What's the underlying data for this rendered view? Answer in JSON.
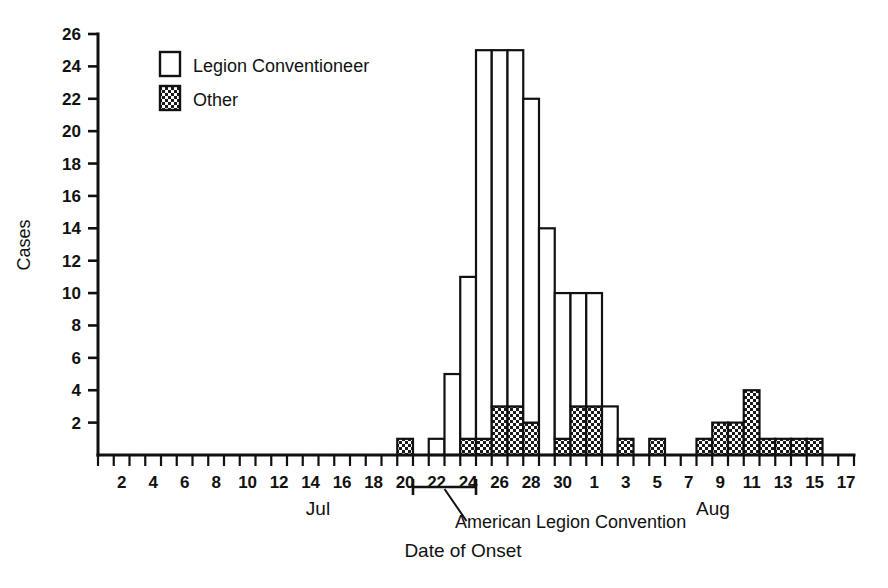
{
  "chart_data": {
    "type": "bar",
    "title": "",
    "xlabel": "Date of Onset",
    "ylabel": "Cases",
    "ylim": [
      0,
      26
    ],
    "y_ticks": [
      2,
      4,
      6,
      8,
      10,
      12,
      14,
      16,
      18,
      20,
      22,
      24,
      26
    ],
    "grid": false,
    "stacked": true,
    "legend": {
      "position": "top-left",
      "entries": [
        {
          "label": "Legion Conventioneer",
          "pattern": "open"
        },
        {
          "label": "Other",
          "pattern": "stipple"
        }
      ]
    },
    "x_axis": {
      "months": [
        "Jul",
        "Aug"
      ],
      "month_label_jul": "Jul",
      "month_label_aug": "Aug",
      "tick_labels_jul": [
        "2",
        "4",
        "6",
        "8",
        "10",
        "12",
        "14",
        "16",
        "18",
        "20",
        "22",
        "24",
        "26",
        "28",
        "30"
      ],
      "tick_labels_aug": [
        "1",
        "3",
        "5",
        "7",
        "9",
        "11",
        "13",
        "15",
        "17"
      ],
      "jul_days": 31,
      "aug_days": 17
    },
    "annotation": {
      "text": "American Legion Convention",
      "bracket_start": "Jul 21",
      "bracket_end": "Jul 24"
    },
    "categories": [
      "Jul 1",
      "Jul 2",
      "Jul 3",
      "Jul 4",
      "Jul 5",
      "Jul 6",
      "Jul 7",
      "Jul 8",
      "Jul 9",
      "Jul 10",
      "Jul 11",
      "Jul 12",
      "Jul 13",
      "Jul 14",
      "Jul 15",
      "Jul 16",
      "Jul 17",
      "Jul 18",
      "Jul 19",
      "Jul 20",
      "Jul 21",
      "Jul 22",
      "Jul 23",
      "Jul 24",
      "Jul 25",
      "Jul 26",
      "Jul 27",
      "Jul 28",
      "Jul 29",
      "Jul 30",
      "Jul 31",
      "Aug 1",
      "Aug 2",
      "Aug 3",
      "Aug 4",
      "Aug 5",
      "Aug 6",
      "Aug 7",
      "Aug 8",
      "Aug 9",
      "Aug 10",
      "Aug 11",
      "Aug 12",
      "Aug 13",
      "Aug 14",
      "Aug 15",
      "Aug 16",
      "Aug 17"
    ],
    "series": [
      {
        "name": "Legion Conventioneer",
        "pattern": "open",
        "values": [
          0,
          0,
          0,
          0,
          0,
          0,
          0,
          0,
          0,
          0,
          0,
          0,
          0,
          0,
          0,
          0,
          0,
          0,
          0,
          0,
          0,
          1,
          5,
          10,
          24,
          22,
          22,
          20,
          14,
          9,
          7,
          7,
          3,
          0,
          0,
          0,
          0,
          0,
          0,
          0,
          0,
          0,
          0,
          0,
          0,
          0,
          0,
          0
        ]
      },
      {
        "name": "Other",
        "pattern": "stipple",
        "values": [
          0,
          0,
          0,
          0,
          0,
          0,
          0,
          0,
          0,
          0,
          0,
          0,
          0,
          0,
          0,
          0,
          0,
          0,
          0,
          1,
          0,
          0,
          0,
          1,
          1,
          3,
          3,
          2,
          0,
          1,
          3,
          3,
          0,
          1,
          0,
          1,
          0,
          0,
          1,
          2,
          2,
          4,
          1,
          1,
          1,
          1,
          0,
          0
        ]
      }
    ],
    "totals": [
      0,
      0,
      0,
      0,
      0,
      0,
      0,
      0,
      0,
      0,
      0,
      0,
      0,
      0,
      0,
      0,
      0,
      0,
      0,
      1,
      0,
      1,
      5,
      11,
      25,
      25,
      25,
      22,
      14,
      10,
      10,
      10,
      3,
      1,
      0,
      1,
      0,
      0,
      1,
      2,
      2,
      4,
      1,
      1,
      1,
      1,
      0,
      0
    ]
  }
}
